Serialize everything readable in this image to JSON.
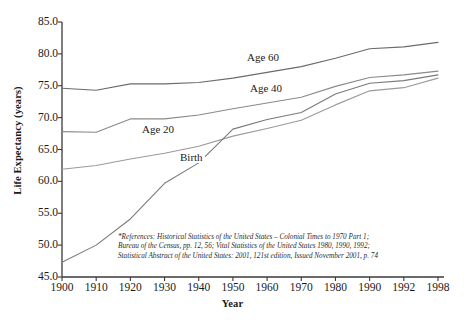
{
  "chart_data": {
    "type": "line",
    "title": "",
    "xlabel": "Year",
    "ylabel": "Life Expectancy (years)",
    "x": [
      1900,
      1910,
      1920,
      1930,
      1940,
      1950,
      1960,
      1970,
      1980,
      1990,
      1992,
      1998
    ],
    "xticklabels": [
      "1900",
      "1910",
      "1920",
      "1930",
      "1940",
      "1950",
      "1960",
      "1970",
      "1980",
      "1990",
      "1992",
      "1998"
    ],
    "yticklabels": [
      "45.0",
      "50.0",
      "55.0",
      "60.0",
      "65.0",
      "70.0",
      "75.0",
      "80.0",
      "85.0"
    ],
    "yticks": [
      45.0,
      50.0,
      55.0,
      60.0,
      65.0,
      70.0,
      75.0,
      80.0,
      85.0
    ],
    "ylim": [
      45.0,
      85.0
    ],
    "grid": false,
    "legend": "inline-labels",
    "series": [
      {
        "name": "Age 60",
        "color": "#6b6b6b",
        "label_x": 245,
        "label_y": 52,
        "values": [
          74.6,
          74.3,
          75.3,
          75.3,
          75.5,
          76.2,
          77.1,
          78.0,
          79.3,
          80.8,
          81.1,
          81.8
        ]
      },
      {
        "name": "Age 40",
        "color": "#8a8a8a",
        "label_x": 248,
        "label_y": 83,
        "values": [
          67.8,
          67.7,
          69.8,
          69.8,
          70.4,
          71.4,
          72.3,
          73.2,
          74.9,
          76.3,
          76.7,
          77.3
        ]
      },
      {
        "name": "Age 20",
        "color": "#9a9a9a",
        "label_x": 140,
        "label_y": 124,
        "values": [
          61.9,
          62.5,
          63.5,
          64.4,
          65.5,
          67.1,
          68.3,
          69.6,
          72.0,
          74.2,
          74.7,
          76.2
        ]
      },
      {
        "name": "Birth",
        "color": "#7a7a7a",
        "label_x": 178,
        "label_y": 152,
        "values": [
          47.3,
          50.0,
          54.1,
          59.7,
          62.9,
          68.2,
          69.7,
          70.8,
          73.7,
          75.4,
          75.8,
          76.7
        ]
      }
    ],
    "footnote": [
      "*References: Historical Statistics of the United States – Colonial Times to 1970 Part 1;",
      "Bureau of the Census, pp. 12, 56; Vital Statistics of the United States 1980, 1990, 1992;",
      "Statistical Abstract of the United States: 2001, 121st edition, Issued November 2001, p. 74"
    ],
    "axis_color": "#3a3a3a",
    "plot_area": {
      "left": 62,
      "right": 438,
      "top": 22,
      "bottom": 277
    }
  }
}
